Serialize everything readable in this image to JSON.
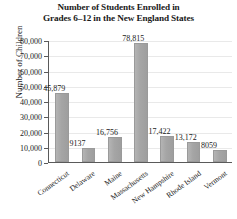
{
  "chart_data": {
    "type": "bar",
    "title": "Number of Students Enrolled in Grades 6–12 in the New England States",
    "title_line1": "Number of Students Enrolled in",
    "title_line2": "Grades 6–12 in the New England States",
    "xlabel": "",
    "ylabel": "Number of Children",
    "ylim": [
      0,
      80000
    ],
    "ytick_step": 10000,
    "grid": true,
    "legend": "none",
    "bar_color": "#a9a9a9",
    "categories": [
      "Connecticut",
      "Delaware",
      "Maine",
      "Massachusetts",
      "New Hampshire",
      "Rhode Island",
      "Vermont"
    ],
    "values": [
      45879,
      9137,
      16756,
      78815,
      17422,
      13172,
      8059
    ],
    "value_labels": [
      "45,879",
      "9137",
      "16,756",
      "78,815",
      "17,422",
      "13,172",
      "8059"
    ],
    "ytick_labels": [
      "80,000",
      "70,000",
      "60,000",
      "50,000",
      "40,000",
      "30,000",
      "20,000",
      "10,000",
      "0"
    ],
    "ytick_values": [
      80000,
      70000,
      60000,
      50000,
      40000,
      30000,
      20000,
      10000,
      0
    ]
  }
}
